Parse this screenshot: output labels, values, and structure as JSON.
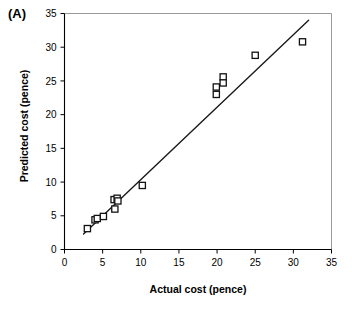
{
  "figure": {
    "panel_label": "(A)",
    "background": "#ffffff"
  },
  "chart_data": {
    "type": "scatter",
    "title": "",
    "panel": "(A)",
    "xlabel": "Actual cost (pence)",
    "ylabel": "Predicted cost (pence)",
    "xlim": [
      0,
      35
    ],
    "ylim": [
      0,
      35
    ],
    "xticks": [
      0,
      5,
      10,
      15,
      20,
      25,
      30,
      35
    ],
    "yticks": [
      0,
      5,
      10,
      15,
      20,
      25,
      30,
      35
    ],
    "xtick_labels": [
      "0",
      "5",
      "10",
      "15",
      "20",
      "25",
      "30",
      "35"
    ],
    "ytick_labels": [
      "0",
      "5",
      "10",
      "15",
      "20",
      "25",
      "30",
      "35"
    ],
    "grid": false,
    "legend": null,
    "marker_style": "open-square",
    "marker_face_color": "#ffffff",
    "marker_edge_color": "#111111",
    "series": [
      {
        "name": "Predicted vs actual cost",
        "marker": "open-square",
        "points": [
          {
            "x": 3.0,
            "y": 3.1
          },
          {
            "x": 4.0,
            "y": 4.4
          },
          {
            "x": 4.3,
            "y": 4.6
          },
          {
            "x": 5.1,
            "y": 4.9
          },
          {
            "x": 6.5,
            "y": 7.4
          },
          {
            "x": 6.6,
            "y": 6.0
          },
          {
            "x": 6.9,
            "y": 7.6
          },
          {
            "x": 7.0,
            "y": 7.2
          },
          {
            "x": 10.2,
            "y": 9.5
          },
          {
            "x": 19.9,
            "y": 24.1
          },
          {
            "x": 19.9,
            "y": 23.0
          },
          {
            "x": 20.8,
            "y": 25.6
          },
          {
            "x": 20.8,
            "y": 24.7
          },
          {
            "x": 25.0,
            "y": 28.8
          },
          {
            "x": 31.2,
            "y": 30.8
          }
        ]
      }
    ],
    "fit_line": {
      "name": "regression line",
      "x_start": 2.5,
      "y_start": 2.3,
      "x_end": 32.0,
      "y_end": 34.0,
      "color": "#1a1a1a"
    }
  }
}
